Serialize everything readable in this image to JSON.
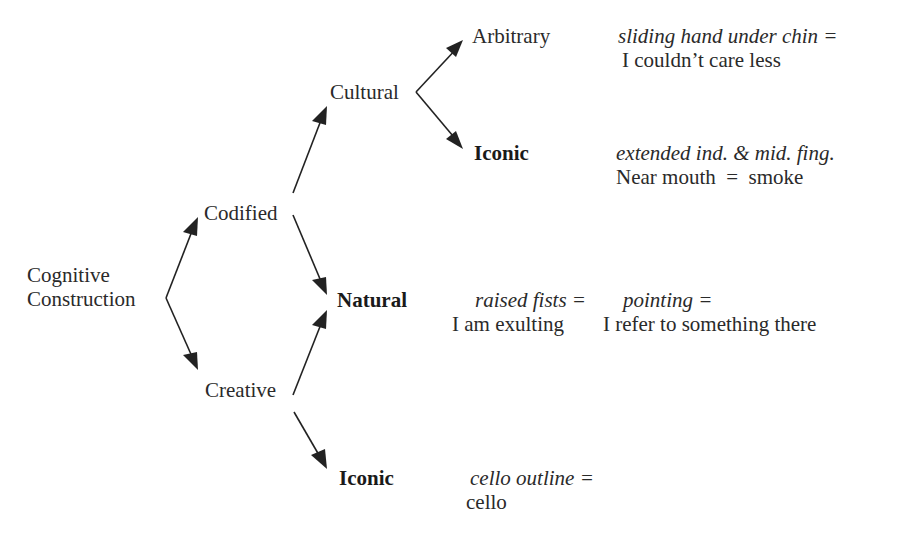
{
  "diagram": {
    "type": "tree",
    "nodes": {
      "root": "Cognitive",
      "root_line2": "Construction",
      "codified": "Codified",
      "creative": "Creative",
      "cultural": "Cultural",
      "natural": "Natural",
      "arbitrary": "Arbitrary",
      "iconic_cultural": "Iconic",
      "iconic_creative": "Iconic"
    },
    "examples": {
      "arbitrary": {
        "gesture": "sliding hand under chin =",
        "meaning": "I couldn’t care less"
      },
      "iconic_cultural": {
        "gesture": "extended ind. & mid. fing.",
        "meaning": "Near mouth  =  smoke"
      },
      "natural_1": {
        "gesture": "raised fists =",
        "meaning": "I am exulting"
      },
      "natural_2": {
        "gesture": "pointing =",
        "meaning": "I refer to something there"
      },
      "iconic_creative": {
        "gesture": "cello outline =",
        "meaning": "cello"
      }
    },
    "edges": [
      [
        "Cognitive Construction",
        "Codified"
      ],
      [
        "Cognitive Construction",
        "Creative"
      ],
      [
        "Codified",
        "Cultural"
      ],
      [
        "Codified",
        "Natural"
      ],
      [
        "Creative",
        "Natural"
      ],
      [
        "Creative",
        "Iconic"
      ],
      [
        "Cultural",
        "Arbitrary"
      ],
      [
        "Cultural",
        "Iconic"
      ]
    ],
    "colors": {
      "text": "#2a2a2a",
      "arrow": "#222222",
      "background": "#ffffff"
    }
  }
}
